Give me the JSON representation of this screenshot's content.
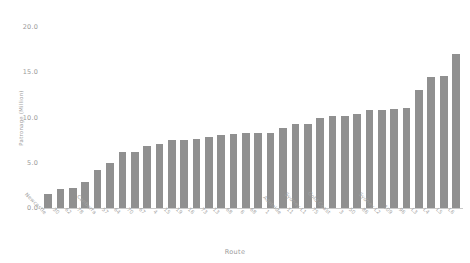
{
  "chart_data": {
    "type": "bar",
    "title": "",
    "xlabel": "Route",
    "ylabel": "Patronage (Million)",
    "ylim": [
      0.0,
      21.0
    ],
    "yticks": [
      "0.0",
      "5.0",
      "10.0",
      "15.0",
      "20.0"
    ],
    "ytick_values": [
      0.0,
      5.0,
      10.0,
      15.0,
      20.0
    ],
    "grid": false,
    "legend": null,
    "bar_color": "#909090",
    "background_color": "#ffffff",
    "categories": [
      "Newcastle",
      "30",
      "62",
      "78",
      "Canberra",
      "57",
      "64",
      "70",
      "67",
      "4",
      "15",
      "19",
      "16",
      "73",
      "13",
      "68",
      "6",
      "68",
      "1",
      "Adelaide",
      "11",
      "Sydney L1",
      "75",
      "Gold Coast",
      "3",
      "50",
      "86",
      "Sydney L2",
      "109",
      "96"
    ],
    "values": [
      1.5,
      2.1,
      2.2,
      2.9,
      4.2,
      5.0,
      6.2,
      6.2,
      6.8,
      7.1,
      7.5,
      7.5,
      7.6,
      7.9,
      8.1,
      8.2,
      8.3,
      8.3,
      8.3,
      8.8,
      9.3,
      9.3,
      9.9,
      10.2,
      10.2,
      10.4,
      10.8,
      10.8,
      10.9,
      11.0
    ],
    "all_categories": [
      "Newcastle",
      "30",
      "62",
      "78",
      "Canberra",
      "57",
      "64",
      "70",
      "67",
      "4",
      "15",
      "19",
      "16",
      "73",
      "13",
      "68",
      "6",
      "68",
      "1",
      "Adelaide",
      "11",
      "Sydney L1",
      "75",
      "Gold Coast",
      "3",
      "50",
      "86",
      "Sydney L2",
      "109",
      "96"
    ],
    "series": [
      {
        "name": "Patronage",
        "points": [
          {
            "category": "Newcastle",
            "value": 1.5
          },
          {
            "category": "30",
            "value": 2.1
          },
          {
            "category": "62",
            "value": 2.2
          },
          {
            "category": "78",
            "value": 2.9
          },
          {
            "category": "Canberra",
            "value": 4.2
          },
          {
            "category": "57",
            "value": 5.0
          },
          {
            "category": "64",
            "value": 6.2
          },
          {
            "category": "70",
            "value": 6.2
          },
          {
            "category": "67",
            "value": 6.8
          },
          {
            "category": "4",
            "value": 7.1
          },
          {
            "category": "15",
            "value": 7.5
          },
          {
            "category": "19",
            "value": 7.5
          },
          {
            "category": "16",
            "value": 7.6
          },
          {
            "category": "73",
            "value": 7.9
          },
          {
            "category": "13",
            "value": 8.1
          },
          {
            "category": "68",
            "value": 8.2
          },
          {
            "category": "6",
            "value": 8.3
          },
          {
            "category": "68",
            "value": 8.3
          },
          {
            "category": "1",
            "value": 8.3
          },
          {
            "category": "Adelaide",
            "value": 8.8
          },
          {
            "category": "11",
            "value": 9.3
          },
          {
            "category": "Sydney L1",
            "value": 9.3
          },
          {
            "category": "75",
            "value": 9.9
          },
          {
            "category": "Gold Coast",
            "value": 10.2
          },
          {
            "category": "3",
            "value": 10.2
          },
          {
            "category": "50",
            "value": 10.4
          },
          {
            "category": "86",
            "value": 10.8
          },
          {
            "category": "Sydney L2",
            "value": 10.8
          },
          {
            "category": "109",
            "value": 10.9
          },
          {
            "category": "96",
            "value": 11.0
          },
          {
            "category": "L3",
            "value": 13.0
          },
          {
            "category": "L4",
            "value": 14.5
          },
          {
            "category": "L5",
            "value": 14.6
          },
          {
            "category": "L6",
            "value": 17.0
          }
        ]
      }
    ]
  }
}
